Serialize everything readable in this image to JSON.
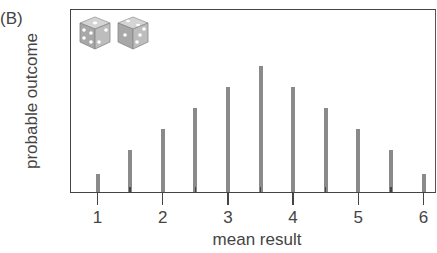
{
  "panel_label": "(B)",
  "chart_data": {
    "type": "bar",
    "title": "",
    "xlabel": "mean result",
    "ylabel": "probable outcome",
    "x": [
      1,
      1.5,
      2,
      2.5,
      3,
      3.5,
      4,
      4.5,
      5,
      5.5,
      6
    ],
    "values": [
      1,
      2,
      3,
      4,
      5,
      6,
      5,
      4,
      3,
      2,
      1
    ],
    "xticks": [
      "1",
      "2",
      "3",
      "4",
      "5",
      "6"
    ],
    "xlim": [
      0.5,
      6.1
    ],
    "ylim": [
      0,
      8.6
    ],
    "grid": false,
    "legend": null,
    "bar_color": "#8a8a8a",
    "annotation": "two dice icons (top-left)"
  },
  "icons": [
    "die-icon",
    "die-icon"
  ]
}
